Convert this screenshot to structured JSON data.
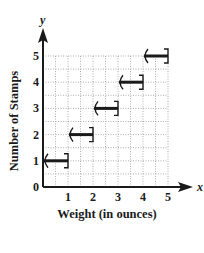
{
  "chart_data": {
    "type": "line",
    "subtype": "step",
    "title": "",
    "xlabel": "Weight (in ounces)",
    "ylabel": "Number of Stamps",
    "x_var": "x",
    "y_var": "y",
    "xlim": [
      0,
      5
    ],
    "ylim": [
      0,
      5
    ],
    "x_ticks": [
      "1",
      "2",
      "3",
      "4",
      "5"
    ],
    "y_ticks": [
      "0",
      "1",
      "2",
      "3",
      "4",
      "5"
    ],
    "grid": true,
    "grid_style": "dotted",
    "grid_step": 0.5,
    "legend": null,
    "steps": [
      {
        "x_start": 0,
        "x_end": 1,
        "y": 1,
        "start": "open",
        "end": "closed"
      },
      {
        "x_start": 1,
        "x_end": 2,
        "y": 2,
        "start": "open",
        "end": "closed"
      },
      {
        "x_start": 2,
        "x_end": 3,
        "y": 3,
        "start": "open",
        "end": "closed"
      },
      {
        "x_start": 3,
        "x_end": 4,
        "y": 4,
        "start": "open",
        "end": "closed"
      },
      {
        "x_start": 4,
        "x_end": 5,
        "y": 5,
        "start": "open",
        "end": "closed"
      }
    ]
  },
  "colors": {
    "ink": "#1a1a1a",
    "grid": "#9a9a9a",
    "background": "#ffffff"
  }
}
